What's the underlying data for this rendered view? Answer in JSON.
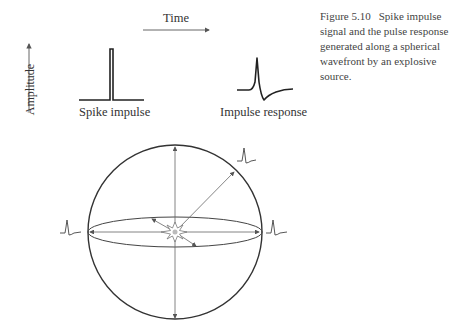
{
  "figure": {
    "caption_number": "Figure 5.10",
    "caption_text": "Spike impulse signal and the pulse response generated along a spherical wavefront by an explosive source."
  },
  "axes": {
    "time_label": "Time",
    "amplitude_label": "Amplitude"
  },
  "signals": {
    "spike_label": "Spike impulse",
    "response_label": "Impulse response"
  },
  "sphere": {
    "center": [
      175,
      232
    ],
    "radius": 87,
    "equator_ry": 15,
    "source_icon": "explosion-icon",
    "wavelets_at": [
      "upper-right",
      "left",
      "right"
    ]
  },
  "colors": {
    "line": "#333333",
    "thin_line": "#666666",
    "text": "#333333"
  }
}
